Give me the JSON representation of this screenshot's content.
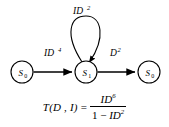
{
  "figure": {
    "background_color": "#ffffff",
    "stroke_color": "#000000"
  },
  "diagram": {
    "type": "state-transition-diagram",
    "nodes": [
      {
        "id": "left",
        "label": "S",
        "subscript": "0",
        "cx": 22,
        "cy": 72,
        "r": 11
      },
      {
        "id": "middle",
        "label": "S",
        "subscript": "1",
        "cx": 86,
        "cy": 72,
        "r": 11
      },
      {
        "id": "right",
        "label": "S",
        "subscript": "0",
        "cx": 149,
        "cy": 72,
        "r": 11
      }
    ],
    "edges": [
      {
        "id": "left-to-middle",
        "from": "left",
        "to": "middle",
        "label_base": "ID",
        "label_exponent": "4",
        "label_x": 44,
        "label_y": 56
      },
      {
        "id": "self-loop-middle",
        "from": "middle",
        "to": "middle",
        "label_base": "ID",
        "label_exponent": "2",
        "label_x": 73,
        "label_y": 14
      },
      {
        "id": "middle-to-right",
        "from": "middle",
        "to": "right",
        "label_base": "D",
        "label_exponent": "2",
        "label_x": 110,
        "label_y": 56
      }
    ]
  },
  "formula": {
    "lhs": "T(D , I)",
    "equals": "=",
    "numerator_base": "ID",
    "numerator_exponent": "6",
    "denominator_one": "1",
    "denominator_minus": "−",
    "denominator_base": "ID",
    "denominator_exponent": "2"
  }
}
